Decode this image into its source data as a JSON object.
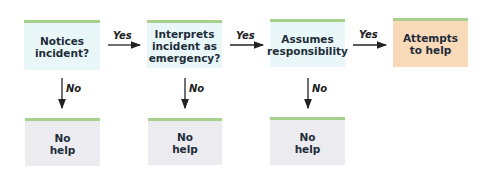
{
  "diagram": {
    "type": "flowchart",
    "steps": [
      {
        "id": "notices",
        "label": "Notices\nincident?"
      },
      {
        "id": "interprets",
        "label": "Interprets\nincident as\nemergency?"
      },
      {
        "id": "assumes",
        "label": "Assumes\nresponsibility"
      },
      {
        "id": "attempts",
        "label": "Attempts\nto help"
      }
    ],
    "no_help": [
      {
        "label": "No\nhelp"
      },
      {
        "label": "No\nhelp"
      },
      {
        "label": "No\nhelp"
      }
    ],
    "edges": {
      "yes_label": "Yes",
      "no_label": "No"
    },
    "colors": {
      "decision_fill": "#eaf7f8",
      "outcome_fill": "#f8d9b8",
      "nohelp_fill": "#ebebf0",
      "top_border": "#a8d08d"
    }
  }
}
